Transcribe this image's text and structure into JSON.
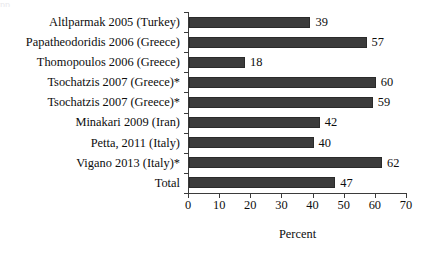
{
  "chart_data": {
    "type": "bar",
    "orientation": "horizontal",
    "title": "",
    "xlabel": "Percent",
    "ylabel": "",
    "xlim": [
      0,
      70
    ],
    "xticks": [
      0,
      10,
      20,
      30,
      40,
      50,
      60,
      70
    ],
    "grid": false,
    "legend": null,
    "bar_color": "#3b3b3b",
    "categories": [
      "Altlparmak 2005 (Turkey)",
      "Papatheodoridis 2006 (Greece)",
      "Thomopoulos 2006 (Greece)",
      "Tsochatzis 2007 (Greece)*",
      "Tsochatzis 2007 (Greece)*",
      "Minakari 2009 (Iran)",
      "Petta, 2011 (Italy)",
      "Vigano 2013 (Italy)*",
      "Total"
    ],
    "values": [
      39,
      57,
      18,
      60,
      59,
      42,
      40,
      62,
      47
    ],
    "value_labels": [
      "39",
      "57",
      "18",
      "60",
      "59",
      "42",
      "40",
      "62",
      "47"
    ]
  },
  "axis": {
    "x_tick_labels": [
      "0",
      "10",
      "20",
      "30",
      "40",
      "50",
      "60",
      "70"
    ],
    "x_title": "Percent"
  },
  "artifacts": {
    "top_cropped_text": "pp"
  }
}
